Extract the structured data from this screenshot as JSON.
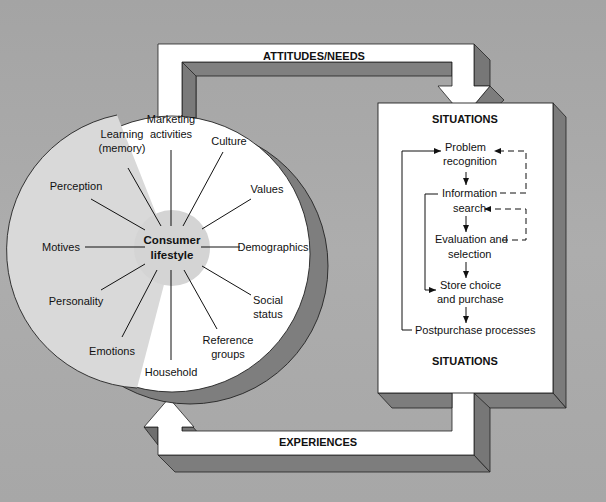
{
  "diagram": {
    "type": "consumer-decision-process-model",
    "colors": {
      "background": "#aaaaaa",
      "white": "#ffffff",
      "shadow": "#7d7d7d",
      "light_sector": "#d9d9d9",
      "center_blob": "#d4d4d4",
      "ink": "#111111"
    },
    "top_arrow": {
      "label": "ATTITUDES/NEEDS"
    },
    "bottom_arrow": {
      "label": "EXPERIENCES"
    },
    "circle": {
      "center_label_line1": "Consumer",
      "center_label_line2": "lifestyle",
      "internal_factors": [
        {
          "line1": "Learning",
          "line2": "(memory)"
        },
        {
          "line1": "Perception",
          "line2": ""
        },
        {
          "line1": "Motives",
          "line2": ""
        },
        {
          "line1": "Personality",
          "line2": ""
        },
        {
          "line1": "Emotions",
          "line2": ""
        }
      ],
      "external_factors": [
        {
          "line1": "Marketing",
          "line2": "activities"
        },
        {
          "line1": "Culture",
          "line2": ""
        },
        {
          "line1": "Values",
          "line2": ""
        },
        {
          "line1": "Demographics",
          "line2": ""
        },
        {
          "line1": "Social",
          "line2": "status"
        },
        {
          "line1": "Reference",
          "line2": "groups"
        },
        {
          "line1": "Household",
          "line2": ""
        }
      ]
    },
    "situations_box": {
      "title_top": "SITUATIONS",
      "title_bottom": "SITUATIONS",
      "steps": [
        {
          "line1": "Problem",
          "line2": "recognition"
        },
        {
          "line1": "Information",
          "line2": "search"
        },
        {
          "line1": "Evaluation and",
          "line2": "selection"
        },
        {
          "line1": "Store choice",
          "line2": "and purchase"
        },
        {
          "line1": "Postpurchase processes",
          "line2": ""
        }
      ]
    }
  }
}
